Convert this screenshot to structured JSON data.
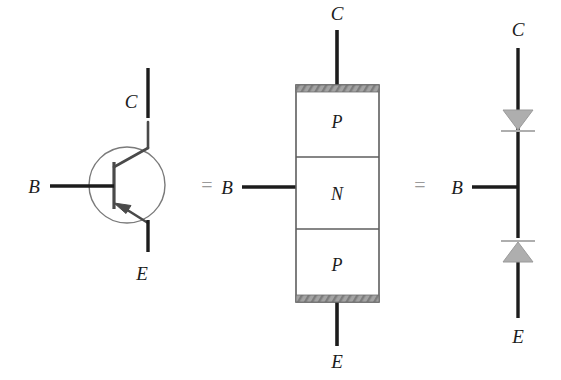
{
  "figure": {
    "background_color": "#ffffff",
    "wire_color": "#1c1c1c",
    "outline_color": "#6e6e6e",
    "diode_fill_color": "#adadad",
    "contact_bar_color": "#9e9e9e",
    "equals_color": "#9a9a9a"
  },
  "symbol_view": {
    "name": "transistor-symbol",
    "collector_label": "C",
    "base_label": "B",
    "emitter_label": "E",
    "arrow_direction": "into-base",
    "device_type": "PNP"
  },
  "equals_1": {
    "text": "="
  },
  "block_view": {
    "name": "pnp-block-diagram",
    "collector_label": "C",
    "base_label": "B",
    "emitter_label": "E",
    "regions": [
      {
        "label": "P"
      },
      {
        "label": "N"
      },
      {
        "label": "P"
      }
    ],
    "top_contact": "metal-contact-bar",
    "bottom_contact": "metal-contact-bar"
  },
  "equals_2": {
    "text": "="
  },
  "diode_view": {
    "name": "two-diode-equivalent",
    "collector_label": "C",
    "base_label": "B",
    "emitter_label": "E",
    "top_diode": {
      "orientation": "pointing-down-toward-base"
    },
    "bottom_diode": {
      "orientation": "pointing-up-toward-base"
    }
  }
}
